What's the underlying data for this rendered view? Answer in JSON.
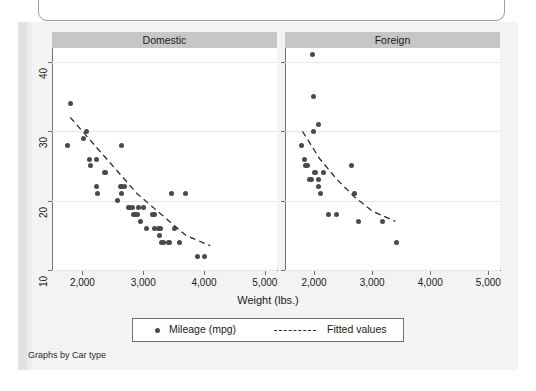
{
  "note": "Graphs by Car type",
  "axis": {
    "x_title": "Weight (lbs.)",
    "x_ticks": [
      "2,000",
      "3,000",
      "4,000",
      "5,000"
    ],
    "y_ticks": [
      "40",
      "30",
      "20",
      "10"
    ]
  },
  "panels": [
    {
      "id": "domestic",
      "label": "Domestic"
    },
    {
      "id": "foreign",
      "label": "Foreign"
    }
  ],
  "legend": {
    "marker_label": "Mileage (mpg)",
    "line_label": "Fitted values",
    "marker_icon": "filled-circle-icon",
    "line_icon": "dashed-line-icon"
  },
  "colors": {
    "marker": "#4a4a4a",
    "panel_header_bg": "#c6c6c6",
    "axis": "#6f6f6f",
    "gridline": "#e8e8e8",
    "page_bg": "#f3f3f3",
    "plot_bg": "#ffffff"
  },
  "chart_data": {
    "type": "scatter",
    "title": "",
    "subtitle": "",
    "xlabel": "Weight (lbs.)",
    "ylabel": "Mileage (mpg)",
    "xlim": [
      1500,
      5200
    ],
    "ylim": [
      10,
      42
    ],
    "xticks": [
      2000,
      3000,
      4000,
      5000
    ],
    "yticks": [
      10,
      20,
      30,
      40
    ],
    "grid": "horizontal",
    "legend_position": "bottom",
    "legend_entries": [
      "Mileage (mpg)",
      "Fitted values"
    ],
    "facet_by": "Car type",
    "panels": [
      {
        "name": "Domestic",
        "series": [
          {
            "name": "Mileage (mpg)",
            "type": "scatter",
            "points": [
              [
                1800,
                34
              ],
              [
                1760,
                28
              ],
              [
                2020,
                29
              ],
              [
                2070,
                30
              ],
              [
                2110,
                26
              ],
              [
                2130,
                25
              ],
              [
                2230,
                26
              ],
              [
                2230,
                22
              ],
              [
                2240,
                21
              ],
              [
                2370,
                24
              ],
              [
                2380,
                24
              ],
              [
                2580,
                20
              ],
              [
                2630,
                22
              ],
              [
                2640,
                28
              ],
              [
                2650,
                22
              ],
              [
                2690,
                22
              ],
              [
                2750,
                19
              ],
              [
                2780,
                19
              ],
              [
                2830,
                19
              ],
              [
                2840,
                18
              ],
              [
                2870,
                18
              ],
              [
                2900,
                18
              ],
              [
                2930,
                19
              ],
              [
                2950,
                17
              ],
              [
                3000,
                19
              ],
              [
                3170,
                18
              ],
              [
                3180,
                18
              ],
              [
                3190,
                16
              ],
              [
                3250,
                16
              ],
              [
                3260,
                15
              ],
              [
                3280,
                16
              ],
              [
                3300,
                14
              ],
              [
                3330,
                14
              ],
              [
                3420,
                14
              ],
              [
                3430,
                14
              ],
              [
                3470,
                21
              ],
              [
                3520,
                16
              ],
              [
                3600,
                14
              ],
              [
                3700,
                21
              ],
              [
                3900,
                12
              ],
              [
                4000,
                12
              ],
              [
                2650,
                21
              ],
              [
                3150,
                18
              ],
              [
                3050,
                16
              ]
            ]
          },
          {
            "name": "Fitted values",
            "type": "line",
            "points": [
              [
                1800,
                32
              ],
              [
                2100,
                29
              ],
              [
                2500,
                25
              ],
              [
                2900,
                21
              ],
              [
                3300,
                18
              ],
              [
                3700,
                15
              ],
              [
                4100,
                13.5
              ]
            ]
          }
        ]
      },
      {
        "name": "Foreign",
        "series": [
          {
            "name": "Mileage (mpg)",
            "type": "scatter",
            "points": [
              [
                1980,
                41
              ],
              [
                1990,
                35
              ],
              [
                1990,
                30
              ],
              [
                2070,
                31
              ],
              [
                1780,
                28
              ],
              [
                1830,
                26
              ],
              [
                1860,
                25
              ],
              [
                1890,
                25
              ],
              [
                1930,
                23
              ],
              [
                1960,
                23
              ],
              [
                2010,
                24
              ],
              [
                2030,
                24
              ],
              [
                2070,
                23
              ],
              [
                2110,
                21
              ],
              [
                2240,
                18
              ],
              [
                2380,
                18
              ],
              [
                2650,
                25
              ],
              [
                2700,
                21
              ],
              [
                2760,
                17
              ],
              [
                3170,
                17
              ],
              [
                3420,
                14
              ],
              [
                2160,
                24
              ],
              [
                2080,
                22
              ]
            ]
          },
          {
            "name": "Fitted values",
            "type": "line",
            "points": [
              [
                1800,
                30
              ],
              [
                2100,
                26
              ],
              [
                2400,
                23
              ],
              [
                2700,
                20.5
              ],
              [
                3000,
                18.5
              ],
              [
                3400,
                17
              ]
            ]
          }
        ]
      }
    ]
  }
}
